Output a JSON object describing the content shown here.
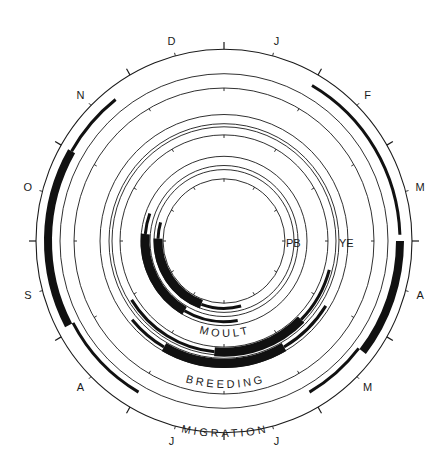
{
  "figure": {
    "type": "circular annual cycle diagram",
    "colors": {
      "ink": "#1a1a1a",
      "background": "#ffffff"
    },
    "months": [
      "J",
      "F",
      "M",
      "A",
      "M",
      "J",
      "J",
      "A",
      "S",
      "O",
      "N",
      "D"
    ],
    "ring_labels": {
      "moult": "MOULT",
      "breeding": "BREEDING",
      "migration": "MIGRATION"
    },
    "species_labels": {
      "pb": "PB",
      "ye": "YE"
    }
  }
}
